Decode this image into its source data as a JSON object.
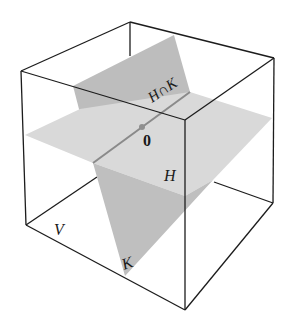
{
  "diagram": {
    "type": "3d-subspace-intersection",
    "colors": {
      "background": "#ffffff",
      "edge": "#1c1c1c",
      "plane_H": "#d6d6d6",
      "plane_K": "#bdbdbd",
      "plane_K_front": "#c4c4c4",
      "intersection_line": "#8a8a8a",
      "origin_point": "#8f8f8f"
    },
    "labels": {
      "space": "V",
      "plane_h": "H",
      "plane_k": "K",
      "intersection": "H∩K",
      "origin": "0"
    }
  }
}
